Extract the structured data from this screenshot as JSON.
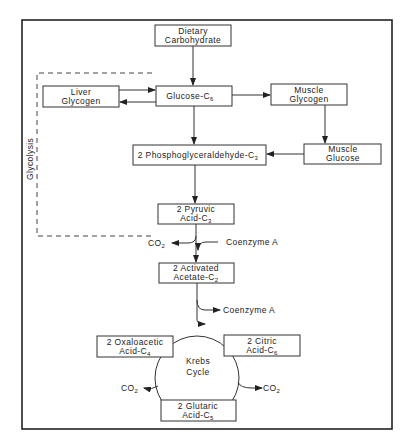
{
  "diagram": {
    "title_label": "Glycolysis",
    "colors": {
      "ink": "#222222",
      "background": "#ffffff"
    },
    "nodes": {
      "dietary": {
        "line1": "Dietary",
        "line2": "Carbohydrate"
      },
      "glucose": {
        "line1": "Glucose-C",
        "sub1": "6"
      },
      "liver": {
        "line1": "Liver",
        "line2": "Glycogen"
      },
      "muscle_glycogen": {
        "line1": "Muscle",
        "line2": "Glycogen"
      },
      "muscle_glucose": {
        "line1": "Muscle",
        "line2": "Glucose"
      },
      "phospho": {
        "line1": "2 Phosphoglyceraldehyde-C",
        "sub1": "3"
      },
      "pyruvic": {
        "line1": "2 Pyruvic",
        "line2": "Acid-C",
        "sub2": "3"
      },
      "acetate": {
        "line1": "2 Activated",
        "line2": "Acetate-C",
        "sub2": "2"
      },
      "oxaloacetic": {
        "line1": "2 Oxaloacetic",
        "line2": "Acid-C",
        "sub2": "4"
      },
      "citric": {
        "line1": "2 Citric",
        "line2": "Acid-C",
        "sub2": "6"
      },
      "glutaric": {
        "line1": "2 Glutaric",
        "line2": "Acid-C",
        "sub2": "5"
      },
      "krebs": {
        "line1": "Krebs",
        "line2": "Cycle"
      }
    },
    "labels": {
      "co2_pyruvate": "CO",
      "co2_pyruvate_sub": "2",
      "coenzyme_in": "Coenzyme  A",
      "coenzyme_out": "Coenzyme  A",
      "co2_left": "CO",
      "co2_left_sub": "2",
      "co2_right": "CO",
      "co2_right_sub": "2"
    }
  }
}
